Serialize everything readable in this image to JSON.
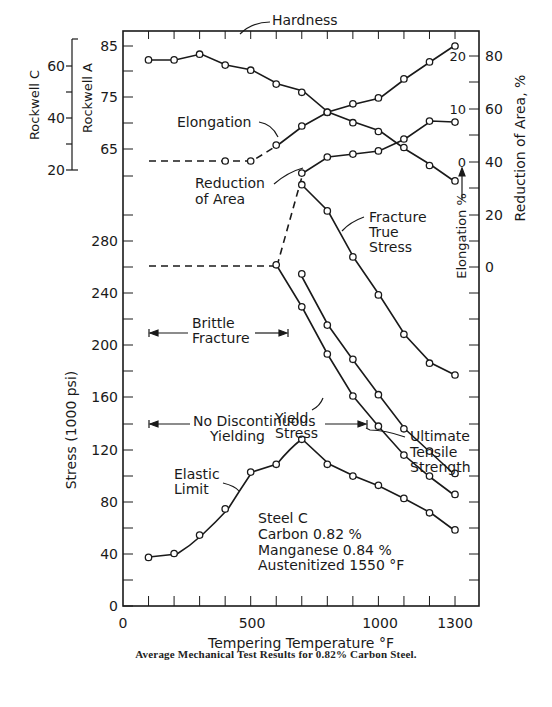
{
  "chart_data": {
    "type": "line",
    "title": "Average Mechanical Test Results for 0.82% Carbon Steel.",
    "xlabel": "Tempering Temperature °F",
    "xlim": [
      0,
      1350
    ],
    "x_ticks": [
      0,
      500,
      1000,
      1300
    ],
    "x_minor_ticks": [
      100,
      200,
      300,
      400,
      500,
      600,
      700,
      800,
      900,
      1000,
      1100,
      1200,
      1300
    ],
    "axes": {
      "stress": {
        "label": "Stress (1000 psi)",
        "ticks": [
          0,
          40,
          80,
          120,
          160,
          200,
          240,
          280
        ],
        "range": [
          0,
          280
        ]
      },
      "rockwell_a": {
        "label": "Rockwell A",
        "ticks": [
          65,
          75,
          85
        ]
      },
      "rockwell_c": {
        "label": "Rockwell C",
        "ticks": [
          20,
          40,
          60
        ]
      },
      "elongation": {
        "label": "Elongation %",
        "ticks": [
          0,
          10,
          20
        ]
      },
      "reduction_of_area": {
        "label": "Reduction of Area, %",
        "ticks": [
          0,
          20,
          40,
          60,
          80
        ]
      }
    },
    "series": [
      {
        "name": "Hardness",
        "axis": "rockwell_a",
        "x": [
          100,
          200,
          300,
          400,
          500,
          600,
          700,
          800,
          900,
          1000,
          1100,
          1200,
          1300
        ],
        "values": [
          82.3,
          82.3,
          83.4,
          81.3,
          80.3,
          77.6,
          76.0,
          72.1,
          70.1,
          68.4,
          65.3,
          61.8,
          58.8
        ]
      },
      {
        "name": "Elongation",
        "axis": "elongation",
        "x": [
          100,
          400,
          500,
          600,
          700,
          800,
          900,
          1000,
          1100,
          1200,
          1300
        ],
        "values": [
          0,
          0,
          0,
          3.0,
          6.6,
          9.2,
          10.8,
          11.9,
          15.5,
          18.7,
          21.7
        ],
        "dashed_until": 500
      },
      {
        "name": "Reduction of Area",
        "axis": "reduction_of_area",
        "x": [
          700,
          800,
          900,
          1000,
          1100,
          1200,
          1300
        ],
        "values": [
          35.8,
          41.9,
          43.0,
          44.2,
          48.7,
          55.5,
          55.1
        ]
      },
      {
        "name": "Fracture True Stress",
        "axis": "stress",
        "x": [
          100,
          600,
          700,
          800,
          900,
          1000,
          1100,
          1200,
          1300
        ],
        "values": [
          260,
          260,
          321,
          301,
          266,
          237,
          207,
          185,
          176
        ],
        "dashed_until": 700
      },
      {
        "name": "Ultimate Tensile Strength",
        "axis": "stress",
        "x": [
          700,
          800,
          900,
          1000,
          1100,
          1200,
          1300
        ],
        "values": [
          253,
          214,
          188,
          161,
          135,
          118,
          101
        ]
      },
      {
        "name": "Yield Stress",
        "axis": "stress",
        "x": [
          600,
          700,
          800,
          900,
          1000,
          1100,
          1200,
          1300
        ],
        "values": [
          260,
          228,
          192,
          160,
          137,
          115,
          99,
          85
        ]
      },
      {
        "name": "Elastic Limit",
        "axis": "stress",
        "x": [
          100,
          200,
          300,
          400,
          500,
          600,
          700,
          800,
          900,
          1000,
          1100,
          1200,
          1300
        ],
        "values": [
          37,
          40,
          54,
          74,
          102,
          108,
          127,
          108,
          99,
          92,
          82,
          71,
          58
        ]
      }
    ],
    "annotations": [
      {
        "text": "Brittle Fracture",
        "x_range": [
          100,
          650
        ],
        "y": 210
      },
      {
        "text": "No Discontinuous Yielding",
        "x_range": [
          100,
          950
        ],
        "y": 140
      },
      {
        "text": "Steel C"
      },
      {
        "text": "Carbon 0.82 %"
      },
      {
        "text": "Manganese 0.84 %"
      },
      {
        "text": "Austenitized 1550 °F"
      }
    ],
    "grid": false,
    "legend": "inline labels"
  },
  "labels": {
    "caption": "Average Mechanical Test Results for 0.82% Carbon Steel.",
    "x_axis_title": "Tempering Temperature °F",
    "y_axis_stress": "Stress (1000 psi)",
    "y_axis_rockwell_a": "Rockwell A",
    "y_axis_rockwell_c": "Rockwell C",
    "y_axis_elongation": "Elongation %",
    "y_axis_reduction": "Reduction of Area, %",
    "hardness": "Hardness",
    "elongation": "Elongation",
    "reduction_line1": "Reduction",
    "reduction_line2": "of Area",
    "fracture_line1": "Fracture",
    "fracture_line2": "True",
    "fracture_line3": "Stress",
    "brittle_line1": "Brittle",
    "brittle_line2": "Fracture",
    "yield_line1": "Yield",
    "yield_line2": "Stress",
    "uts_line1": "Ultimate",
    "uts_line2": "Tensile",
    "uts_line3": "Strength",
    "nodisc_line1": "No Discontinuous",
    "nodisc_line2": "Yielding",
    "elastic_line1": "Elastic",
    "elastic_line2": "Limit",
    "steel": "Steel C",
    "carbon": "Carbon 0.82 %",
    "manganese": "Manganese 0.84 %",
    "austenitized": "Austenitized 1550 °F"
  },
  "ticks": {
    "x": [
      "0",
      "500",
      "1000",
      "1300"
    ],
    "stress": [
      "0",
      "40",
      "80",
      "120",
      "160",
      "200",
      "240",
      "280"
    ],
    "rockwell_a": [
      "85",
      "75",
      "65"
    ],
    "rockwell_c": [
      "60",
      "40",
      "20"
    ],
    "elong": [
      "20",
      "10",
      "0",
      "0"
    ],
    "ra": [
      "80",
      "60",
      "40",
      "20"
    ]
  }
}
